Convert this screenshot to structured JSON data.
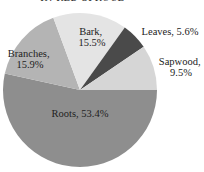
{
  "chart_data": {
    "type": "pie",
    "title": "IN RED SPRUCE",
    "unit": "%",
    "start_angle_deg": 0,
    "direction": "clockwise",
    "slices": [
      {
        "name": "Roots",
        "value": 53.4,
        "label": "Roots, 53.4%",
        "color": "#8e8e8e"
      },
      {
        "name": "Branches",
        "value": 15.9,
        "label": "Branches, 15.9%",
        "color": "#b4b4b4"
      },
      {
        "name": "Bark",
        "value": 15.5,
        "label": "Bark, 15.5%",
        "color": "#e4e4e4"
      },
      {
        "name": "Leaves",
        "value": 5.6,
        "label": "Leaves, 5.6%",
        "color": "#4a4a4a"
      },
      {
        "name": "Sapwood",
        "value": 9.5,
        "label": "Sapwood, 9.5%",
        "color": "#d6d6d6"
      }
    ],
    "categories": [
      "Roots",
      "Branches",
      "Bark",
      "Leaves",
      "Sapwood"
    ],
    "values": [
      53.4,
      15.9,
      15.5,
      5.6,
      9.5
    ],
    "legend": "none (inline labels)"
  },
  "labels": {
    "roots": [
      "Roots, 53.4%"
    ],
    "branches": [
      "Branches,",
      "15.9%"
    ],
    "bark": [
      "Bark,",
      "15.5%"
    ],
    "leaves": [
      "Leaves, 5.6%"
    ],
    "sapwood": [
      "Sapwood,",
      "9.5%"
    ]
  }
}
